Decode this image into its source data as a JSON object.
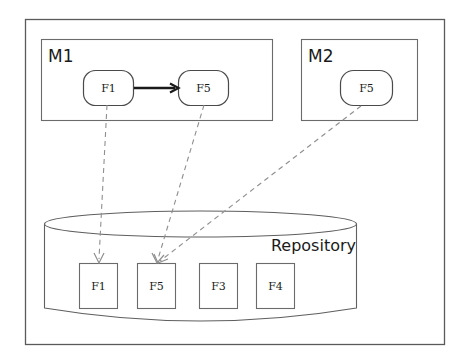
{
  "diagram": {
    "outer_frame": {
      "name": "system-boundary"
    },
    "modules": [
      {
        "id": "M1",
        "label": "M1",
        "nodes": [
          {
            "id": "m1-f1",
            "label": "F1"
          },
          {
            "id": "m1-f5",
            "label": "F5"
          }
        ],
        "internal_edge": {
          "from": "F1",
          "to": "F5",
          "style": "solid-arrow"
        }
      },
      {
        "id": "M2",
        "label": "M2",
        "nodes": [
          {
            "id": "m2-f5",
            "label": "F5"
          }
        ]
      }
    ],
    "repository": {
      "label": "Repository",
      "shape": "cylinder",
      "items": [
        {
          "id": "repo-f1",
          "label": "F1"
        },
        {
          "id": "repo-f5",
          "label": "F5"
        },
        {
          "id": "repo-f3",
          "label": "F3"
        },
        {
          "id": "repo-f4",
          "label": "F4"
        }
      ]
    },
    "links": [
      {
        "id": "link-m1f1-repof1",
        "from": "M1.F1",
        "to": "Repository.F1",
        "style": "dashed"
      },
      {
        "id": "link-m1f5-repof5",
        "from": "M1.F5",
        "to": "Repository.F5",
        "style": "dashed"
      },
      {
        "id": "link-m2f5-repof5",
        "from": "M2.F5",
        "to": "Repository.F5",
        "style": "dashed"
      }
    ],
    "colors": {
      "background": "#ffffff",
      "frame": "#5a5a5a",
      "node_stroke": "#4a4a4a",
      "dashed_link": "#8f8f8f",
      "solid_link": "#1a1a1a",
      "text": "#1a1a1a"
    }
  }
}
